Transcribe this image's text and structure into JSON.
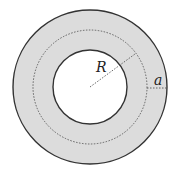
{
  "diagram": {
    "type": "annulus",
    "colors": {
      "ring_fill": "#dcdcdc",
      "outline": "#333333",
      "dotted": "#555555",
      "background": "#ffffff"
    },
    "geometry": {
      "center": [
        90,
        87
      ],
      "outer_radius": 77,
      "mean_radius": 57,
      "inner_radius": 37
    },
    "labels": {
      "radius": "R",
      "half_width": "a"
    }
  }
}
